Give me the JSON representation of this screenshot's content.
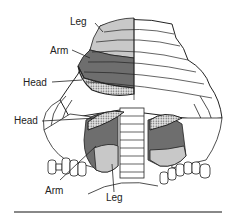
{
  "labels": {
    "top_leg": "Leg",
    "top_arm": "Arm",
    "top_head": "Head",
    "bottom_head": "Head",
    "bottom_arm": "Arm",
    "bottom_leg": "Leg"
  },
  "colors": {
    "leg": "#c8c8c8",
    "arm": "#6e6e6e",
    "head_pattern": "#9a9a9a",
    "outline": "#222222",
    "background": "#ffffff",
    "rule": "#888888"
  }
}
